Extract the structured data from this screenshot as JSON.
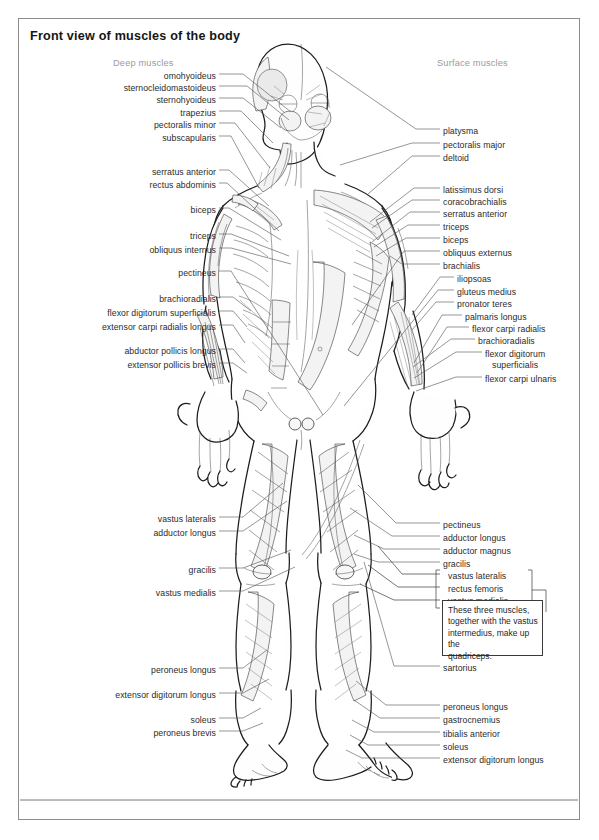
{
  "figure": {
    "title": "Front view of muscles of the body",
    "column_headings": {
      "left": "Deep muscles",
      "right": "Surface muscles"
    }
  },
  "labels_left": [
    {
      "text": "omohyoideus",
      "x": 216,
      "y": 76
    },
    {
      "text": "sternocleidomastoideus",
      "x": 216,
      "y": 88
    },
    {
      "text": "sternohyoideus",
      "x": 216,
      "y": 100
    },
    {
      "text": "trapezius",
      "x": 216,
      "y": 113
    },
    {
      "text": "pectoralis minor",
      "x": 216,
      "y": 125
    },
    {
      "text": "subscapularis",
      "x": 216,
      "y": 138
    },
    {
      "text": "serratus anterior",
      "x": 216,
      "y": 172
    },
    {
      "text": "rectus abdominis",
      "x": 216,
      "y": 185
    },
    {
      "text": "biceps",
      "x": 216,
      "y": 210
    },
    {
      "text": "triceps",
      "x": 216,
      "y": 236
    },
    {
      "text": "obliquus internus",
      "x": 216,
      "y": 250
    },
    {
      "text": "pectineus",
      "x": 216,
      "y": 273
    },
    {
      "text": "brachioradialis",
      "x": 216,
      "y": 299
    },
    {
      "text": "flexor digitorum superficialis",
      "x": 216,
      "y": 313
    },
    {
      "text": "extensor carpi radialis longus",
      "x": 216,
      "y": 327
    },
    {
      "text": "abductor pollicis longus",
      "x": 216,
      "y": 351
    },
    {
      "text": "extensor pollicis brevis",
      "x": 216,
      "y": 365
    },
    {
      "text": "vastus lateralis",
      "x": 216,
      "y": 519
    },
    {
      "text": "adductor longus",
      "x": 216,
      "y": 533
    },
    {
      "text": "gracilis",
      "x": 216,
      "y": 570
    },
    {
      "text": "vastus medialis",
      "x": 216,
      "y": 593
    },
    {
      "text": "peroneus longus",
      "x": 216,
      "y": 670
    },
    {
      "text": "extensor digitorum longus",
      "x": 216,
      "y": 695
    },
    {
      "text": "soleus",
      "x": 216,
      "y": 720
    },
    {
      "text": "peroneus brevis",
      "x": 216,
      "y": 733
    }
  ],
  "labels_right": [
    {
      "text": "platysma",
      "x": 443,
      "y": 131
    },
    {
      "text": "pectoralis major",
      "x": 443,
      "y": 145
    },
    {
      "text": "deltoid",
      "x": 443,
      "y": 158
    },
    {
      "text": "latissimus dorsi",
      "x": 443,
      "y": 190
    },
    {
      "text": "coracobrachialis",
      "x": 443,
      "y": 202
    },
    {
      "text": "serratus anterior",
      "x": 443,
      "y": 214
    },
    {
      "text": "triceps",
      "x": 443,
      "y": 227
    },
    {
      "text": "biceps",
      "x": 443,
      "y": 240
    },
    {
      "text": "obliquus externus",
      "x": 443,
      "y": 253
    },
    {
      "text": "brachialis",
      "x": 443,
      "y": 266
    },
    {
      "text": "iliopsoas",
      "x": 457,
      "y": 279
    },
    {
      "text": "gluteus medius",
      "x": 457,
      "y": 292
    },
    {
      "text": "pronator teres",
      "x": 457,
      "y": 304
    },
    {
      "text": "palmaris longus",
      "x": 465,
      "y": 317
    },
    {
      "text": "flexor carpi radialis",
      "x": 472,
      "y": 329
    },
    {
      "text": "brachioradialis",
      "x": 478,
      "y": 341
    },
    {
      "text": "flexor digitorum",
      "x": 485,
      "y": 354
    },
    {
      "text": "superficialis",
      "x": 492,
      "y": 365
    },
    {
      "text": "flexor carpi ulnaris",
      "x": 485,
      "y": 379
    },
    {
      "text": "pectineus",
      "x": 443,
      "y": 525
    },
    {
      "text": "adductor longus",
      "x": 443,
      "y": 538
    },
    {
      "text": "adductor magnus",
      "x": 443,
      "y": 551
    },
    {
      "text": "gracilis",
      "x": 443,
      "y": 564
    },
    {
      "text": "vastus lateralis",
      "x": 448,
      "y": 576
    },
    {
      "text": "rectus femoris",
      "x": 448,
      "y": 589
    },
    {
      "text": "vastus medialis",
      "x": 448,
      "y": 601
    },
    {
      "text": "sartorius",
      "x": 443,
      "y": 668
    },
    {
      "text": "peroneus longus",
      "x": 443,
      "y": 707
    },
    {
      "text": "gastrocnemius",
      "x": 443,
      "y": 720
    },
    {
      "text": "tibialis anterior",
      "x": 443,
      "y": 734
    },
    {
      "text": "soleus",
      "x": 443,
      "y": 747
    },
    {
      "text": "extensor digitorum longus",
      "x": 443,
      "y": 760
    }
  ],
  "callout": {
    "text": "These three muscles,\ntogether with  the vastus\nintermedius,  make up the\nquadriceps."
  },
  "colors": {
    "frame": "#8c8c8c",
    "title": "#161616",
    "heading": "#9a9a9a",
    "label": "#2b2b2b",
    "leader": "#555555",
    "outline": "#1d1d1d",
    "muscle_fill": "#f3f3f3"
  }
}
